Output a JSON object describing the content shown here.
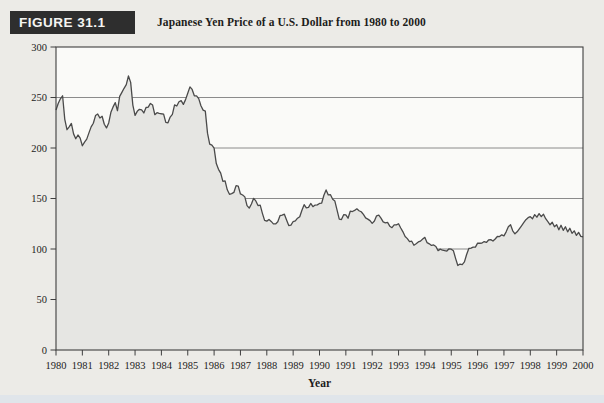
{
  "figure": {
    "label": "FIGURE 31.1",
    "title": "Japanese Yen Price of a U.S. Dollar from 1980 to 2000"
  },
  "colors": {
    "header_badge_bg": "#2e2e2e",
    "header_badge_text": "#f4f4f2",
    "page_bg": "#ecebe7",
    "plot_bg": "#fafaf8",
    "area_fill": "#e6e6e3",
    "line_stroke": "#4a4a4a",
    "grid_stroke": "#6f6f6f",
    "axis_stroke": "#3f3f3f",
    "label_text": "#1c1c1c",
    "bottom_band": "#e0e5ea"
  },
  "chart_data": {
    "type": "area",
    "title": "Japanese Yen Price of a U.S. Dollar from 1980 to 2000",
    "xlabel": "Year",
    "ylabel": "",
    "xlim": [
      1980,
      2000
    ],
    "ylim": [
      0,
      300
    ],
    "x_ticks": [
      1980,
      1981,
      1982,
      1983,
      1984,
      1985,
      1986,
      1987,
      1988,
      1989,
      1990,
      1991,
      1992,
      1993,
      1994,
      1995,
      1996,
      1997,
      1998,
      1999,
      2000
    ],
    "y_ticks": [
      0,
      50,
      100,
      150,
      200,
      250,
      300
    ],
    "grid": "horizontal-50s-behind-fill",
    "legend": "none",
    "series": [
      {
        "name": "Japanese yen per U.S. dollar",
        "unit": "yen/USD",
        "frequency": "monthly",
        "values_by_year": {
          "1980": [
            237.7,
            244.1,
            248.7,
            251.7,
            228.4,
            218.1,
            220.9,
            224.3,
            214.0,
            209.2,
            212.9,
            209.8
          ],
          "1981": [
            202.2,
            205.8,
            208.8,
            215.0,
            220.9,
            224.5,
            232.1,
            233.6,
            229.7,
            231.4,
            223.5,
            219.9
          ],
          "1982": [
            224.8,
            235.3,
            240.7,
            244.9,
            236.9,
            251.1,
            255.1,
            259.1,
            262.7,
            271.3,
            265.0,
            242.5
          ],
          "1983": [
            232.3,
            236.3,
            238.3,
            237.7,
            234.7,
            240.1,
            240.5,
            244.1,
            242.5,
            233.0,
            235.0,
            234.3
          ],
          "1984": [
            233.9,
            233.6,
            225.3,
            224.9,
            230.6,
            233.3,
            242.7,
            241.6,
            245.8,
            246.9,
            243.2,
            247.9
          ],
          "1985": [
            254.2,
            260.5,
            258.0,
            251.7,
            251.6,
            248.9,
            241.8,
            237.5,
            236.5,
            214.7,
            203.9,
            202.8
          ],
          "1986": [
            199.9,
            184.6,
            178.9,
            175.1,
            166.9,
            167.5,
            158.6,
            154.2,
            154.8,
            156.0,
            162.7,
            162.3
          ],
          "1987": [
            154.5,
            153.5,
            151.6,
            142.9,
            140.5,
            144.5,
            150.2,
            147.6,
            143.0,
            143.5,
            135.3,
            128.3
          ],
          "1988": [
            127.6,
            129.2,
            127.3,
            124.9,
            124.8,
            127.0,
            133.0,
            133.6,
            134.5,
            128.8,
            123.2,
            123.6
          ],
          "1989": [
            127.2,
            127.8,
            130.5,
            132.0,
            138.4,
            143.9,
            140.8,
            141.2,
            145.1,
            141.9,
            143.5,
            143.7
          ],
          "1990": [
            145.1,
            145.5,
            153.2,
            158.5,
            153.5,
            153.8,
            149.2,
            147.5,
            138.4,
            129.6,
            129.2,
            133.9
          ],
          "1991": [
            133.7,
            130.5,
            137.4,
            137.1,
            138.2,
            139.8,
            137.9,
            136.9,
            134.3,
            130.8,
            129.6,
            128.1
          ],
          "1992": [
            125.4,
            127.7,
            132.8,
            133.5,
            130.6,
            126.8,
            125.9,
            126.3,
            122.6,
            121.1,
            123.9,
            123.9
          ],
          "1993": [
            125.0,
            120.8,
            117.0,
            112.4,
            110.3,
            107.3,
            107.7,
            103.7,
            105.3,
            107.0,
            107.8,
            109.9
          ],
          "1994": [
            111.5,
            106.3,
            105.1,
            103.5,
            104.0,
            102.5,
            98.4,
            99.9,
            98.8,
            98.4,
            98.0,
            100.2
          ],
          "1995": [
            99.8,
            98.2,
            90.5,
            83.7,
            85.1,
            84.6,
            87.2,
            94.6,
            100.5,
            100.8,
            101.9,
            101.9
          ],
          "1996": [
            105.8,
            105.7,
            105.9,
            107.4,
            106.5,
            108.9,
            109.3,
            107.9,
            109.9,
            112.4,
            112.3,
            114.0
          ],
          "1997": [
            113.0,
            117.0,
            122.0,
            124.0,
            118.0,
            115.0,
            117.0,
            120.0,
            123.0,
            126.0,
            129.0,
            131.0
          ],
          "1998": [
            132.0,
            130.0,
            134.0,
            131.5,
            135.0,
            132.0,
            134.5,
            130.0,
            127.0,
            124.0,
            126.5,
            122.0
          ],
          "1999": [
            124.0,
            119.0,
            123.5,
            118.5,
            122.0,
            117.0,
            120.5,
            115.5,
            118.0,
            113.5,
            116.5,
            112.5
          ],
          "2000": [
            112.0
          ]
        }
      }
    ]
  }
}
